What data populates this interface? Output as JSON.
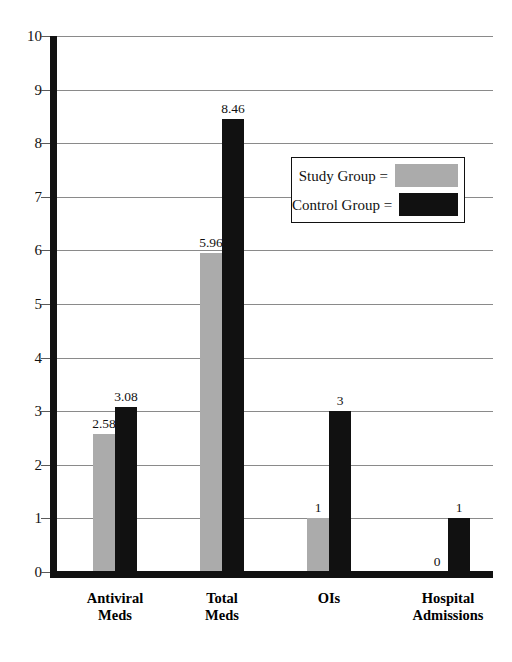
{
  "chart_data": {
    "type": "bar",
    "title": "",
    "subtitle": "",
    "xlabel": "",
    "ylabel": "",
    "ylim": [
      0,
      10
    ],
    "ytick_labels": [
      "10",
      "9",
      "8",
      "7",
      "6",
      "5",
      "4",
      "3",
      "2",
      "1",
      "0"
    ],
    "ytick_values": [
      10,
      9,
      8,
      7,
      6,
      5,
      4,
      3,
      2,
      1,
      0
    ],
    "grid": true,
    "legend_position": "upper right inside",
    "categories": [
      "Antiviral\nMeds",
      "Total\nMeds",
      "OIs",
      "Hospital\nAdmissions"
    ],
    "series": [
      {
        "name": "Study Group =",
        "color": "#ababab",
        "values": [
          2.58,
          5.96,
          1,
          0
        ],
        "value_labels": [
          "2.58",
          "5.96",
          "1",
          "0"
        ]
      },
      {
        "name": "Control Group =",
        "color": "#111111",
        "values": [
          3.08,
          8.46,
          3,
          1
        ],
        "value_labels": [
          "3.08",
          "8.46",
          "3",
          "1"
        ]
      }
    ]
  },
  "legend": {
    "entries": [
      {
        "label": "Study Group =",
        "color": "#ababab",
        "swatch": "study-swatch"
      },
      {
        "label": "Control Group =",
        "color": "#111111",
        "swatch": "control-swatch"
      }
    ]
  },
  "axes": {
    "y": {
      "labels": [
        "10",
        "9",
        "8",
        "7",
        "6",
        "5",
        "4",
        "3",
        "2",
        "1",
        "0"
      ]
    },
    "x": {
      "labels": [
        "Antiviral\nMeds",
        "Total\nMeds",
        "OIs",
        "Hospital\nAdmissions"
      ]
    }
  },
  "colors": {
    "study_group": "#ababab",
    "control_group": "#111111",
    "gridline": "#8a8a8a",
    "axis": "#111111",
    "background": "#ffffff"
  }
}
